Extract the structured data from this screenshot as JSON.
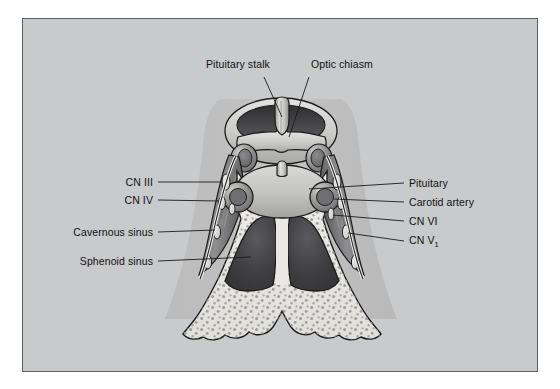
{
  "figure": {
    "frame": {
      "background_color": "#c9cacb",
      "border_color": "#5b5d5f",
      "outer_background_color": "#ffffff"
    }
  },
  "labels": {
    "pituitary_stalk": "Pituitary stalk",
    "optic_chiasm": "Optic chiasm",
    "cn_iii": "CN III",
    "cn_iv": "CN IV",
    "cavernous_sinus": "Cavernous sinus",
    "sphenoid_sinus": "Sphenoid sinus",
    "pituitary": "Pituitary",
    "carotid_artery": "Carotid artery",
    "cn_vi": "CN VI",
    "cn_v1_main": "CN V",
    "cn_v1_sub": "1"
  },
  "structures": {
    "optic_chiasm_ring": "optic-chiasm-ring",
    "pituitary_stalk_body": "pituitary-stalk",
    "pituitary_gland": "pituitary-gland",
    "left_carotid_siphon": "left-carotid-artery",
    "right_carotid_siphon": "right-carotid-artery",
    "left_cavernous_sinus": "left-cavernous-sinus",
    "right_cavernous_sinus": "right-cavernous-sinus",
    "left_sphenoid_sinus_cavity": "left-sphenoid-sinus-cavity",
    "right_sphenoid_sinus_cavity": "right-sphenoid-sinus-cavity",
    "sphenoid_septum": "sphenoid-septum",
    "sphenoid_bone": "sphenoid-bone"
  },
  "colors": {
    "bone_fill": "#e8e7e2",
    "bone_stipple": "#9a9a99",
    "sinus_cavity_dark": "#3a3a3c",
    "sinus_cavity_mid": "#6e6e70",
    "cavernous_dark": "#4d4d4f",
    "cavernous_mid": "#8d8d8e",
    "chiasm_light": "#d4d4d2",
    "chiasm_interior": "#4a4a4c",
    "pituitary_fill": "#c3c3c2",
    "backdrop_shadow": "#bcbcbd",
    "outline": "#1b1b1b",
    "leader_line": "#1b1b1b",
    "text": "#111111"
  }
}
